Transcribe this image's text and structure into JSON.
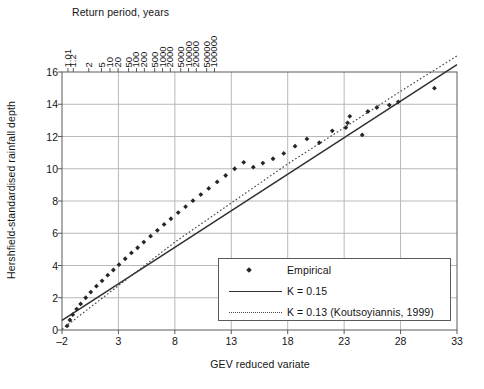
{
  "chart_data": {
    "type": "scatter",
    "title": "",
    "xlabel": "GEV reduced variate",
    "ylabel": "Hershfield-standardised rainfall depth",
    "secondary_xlabel": "Return period, years",
    "xlim": [
      -2,
      33
    ],
    "ylim": [
      0,
      16
    ],
    "xticks": [
      -2,
      3,
      8,
      13,
      18,
      23,
      28,
      33
    ],
    "yticks": [
      0,
      2,
      4,
      6,
      8,
      10,
      12,
      14,
      16
    ],
    "grid": "horizontal-and-vertical",
    "legend_position": "lower-right-inside",
    "top_axis": {
      "label": "Return period, years",
      "ticks": [
        "1.01",
        "1.2",
        "2",
        "5",
        "10",
        "20",
        "50",
        "100",
        "200",
        "500",
        "1000",
        "2000",
        "5000",
        "10000",
        "20000",
        "50000",
        "100000"
      ],
      "tick_x": [
        -1.47,
        -1.0,
        0.37,
        1.5,
        2.25,
        2.97,
        3.9,
        4.6,
        5.3,
        6.21,
        6.91,
        7.6,
        8.52,
        9.21,
        9.9,
        10.82,
        11.51
      ]
    },
    "series": [
      {
        "name": "Empirical",
        "type": "scatter",
        "marker": "diamond",
        "color": "#262626",
        "points": [
          [
            -1.55,
            0.25
          ],
          [
            -1.3,
            0.62
          ],
          [
            -1.05,
            0.95
          ],
          [
            -0.7,
            1.3
          ],
          [
            -0.35,
            1.62
          ],
          [
            0.1,
            2.0
          ],
          [
            0.55,
            2.35
          ],
          [
            1.05,
            2.72
          ],
          [
            1.55,
            3.05
          ],
          [
            2.05,
            3.4
          ],
          [
            2.55,
            3.72
          ],
          [
            3.05,
            4.05
          ],
          [
            3.6,
            4.42
          ],
          [
            4.15,
            4.78
          ],
          [
            4.7,
            5.1
          ],
          [
            5.25,
            5.45
          ],
          [
            5.85,
            5.82
          ],
          [
            6.45,
            6.18
          ],
          [
            7.05,
            6.55
          ],
          [
            7.65,
            6.9
          ],
          [
            8.3,
            7.28
          ],
          [
            8.95,
            7.65
          ],
          [
            9.6,
            8.02
          ],
          [
            10.3,
            8.4
          ],
          [
            11.0,
            8.78
          ],
          [
            11.75,
            9.18
          ],
          [
            12.5,
            9.58
          ],
          [
            13.3,
            10.0
          ],
          [
            14.1,
            10.4
          ],
          [
            14.95,
            10.1
          ],
          [
            15.8,
            10.35
          ],
          [
            16.7,
            10.62
          ],
          [
            17.65,
            10.95
          ],
          [
            18.65,
            11.4
          ],
          [
            19.7,
            11.85
          ],
          [
            20.8,
            11.62
          ],
          [
            21.95,
            12.35
          ],
          [
            23.15,
            12.55
          ],
          [
            23.3,
            12.85
          ],
          [
            23.5,
            13.25
          ],
          [
            24.6,
            12.1
          ],
          [
            25.1,
            13.55
          ],
          [
            25.9,
            13.8
          ],
          [
            27.0,
            13.95
          ],
          [
            27.8,
            14.15
          ],
          [
            31.0,
            15.0
          ]
        ]
      },
      {
        "name": "K = 0.15",
        "type": "line",
        "style": "solid",
        "color": "#303030",
        "points": [
          [
            -2.0,
            0.6
          ],
          [
            33.0,
            16.45
          ]
        ]
      },
      {
        "name": "K = 0.13 (Koutsoyiannis, 1999)",
        "type": "line",
        "style": "dotted",
        "color": "#4a4a4a",
        "points": [
          [
            -2.0,
            0.05
          ],
          [
            8.0,
            5.45
          ],
          [
            18.0,
            10.3
          ],
          [
            28.0,
            14.8
          ],
          [
            33.0,
            17.0
          ]
        ]
      }
    ]
  },
  "legend": {
    "items": [
      {
        "label": "Empirical",
        "key": "diamond-marker"
      },
      {
        "label": "K = 0.15",
        "key": "solid-line"
      },
      {
        "label": "K =  0.13 (Koutsoyiannis, 1999)",
        "key": "dotted-line"
      }
    ]
  },
  "axes": {
    "y_label": "Hershfield-standardised rainfall depth",
    "x_label": "GEV reduced variate",
    "top_label": "Return period, years",
    "y_ticks": [
      "16",
      "14",
      "12",
      "10",
      "8",
      "6",
      "4",
      "2",
      "0"
    ],
    "x_ticks": [
      "–2",
      "3",
      "8",
      "13",
      "18",
      "23",
      "28",
      "33"
    ],
    "top_ticks": [
      "1.01",
      "1.2",
      "2",
      "5",
      "10",
      "20",
      "50",
      "100",
      "200",
      "500",
      "1000",
      "2000",
      "5000",
      "10000",
      "20000",
      "50000",
      "100000"
    ]
  },
  "colors": {
    "axis": "#5a5a5a",
    "grid": "#b8b8b8",
    "marker": "#262626",
    "solid_line": "#303030",
    "dotted_line": "#4a4a4a",
    "text": "#141414"
  }
}
